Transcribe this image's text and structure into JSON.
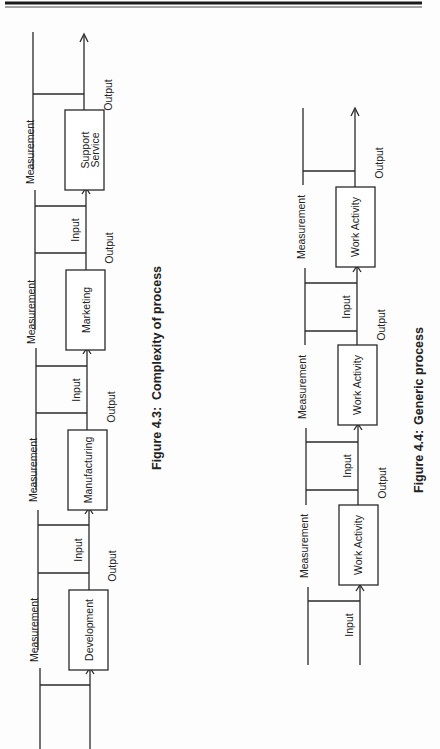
{
  "page": {
    "orientation": "rotated-90-ccw"
  },
  "figure_4_3": {
    "caption_number": "Figure 4.3:",
    "caption_title": "Complexity of process",
    "stages": [
      {
        "label_line1": "Development",
        "label_line2": ""
      },
      {
        "label_line1": "Manufacturing",
        "label_line2": ""
      },
      {
        "label_line1": "Marketing",
        "label_line2": ""
      },
      {
        "label_line1": "Support",
        "label_line2": "Service"
      }
    ],
    "measurement_label": "Measurement",
    "input_label": "Input",
    "output_label": "Output"
  },
  "figure_4_4": {
    "caption_number": "Figure 4.4:",
    "caption_title": "Generic process",
    "stages": [
      {
        "label": "Work Activity"
      },
      {
        "label": "Work Activity"
      },
      {
        "label": "Work Activity"
      }
    ],
    "measurement_label": "Measurement",
    "input_label": "Input",
    "output_label": "Output"
  }
}
